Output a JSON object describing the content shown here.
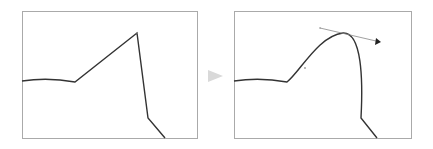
{
  "figure": {
    "before_panel": {
      "label": "before",
      "path_type": "corner-point polyline"
    },
    "transition": {
      "icon": "play-arrow-icon",
      "color": "#d8d8d8"
    },
    "after_panel": {
      "label": "after",
      "path_type": "smooth curve with direction handle"
    },
    "colors": {
      "frame": "#aaaaaa",
      "path": "#333333",
      "handle": "#888888",
      "arrow": "#d9d9d9"
    }
  }
}
